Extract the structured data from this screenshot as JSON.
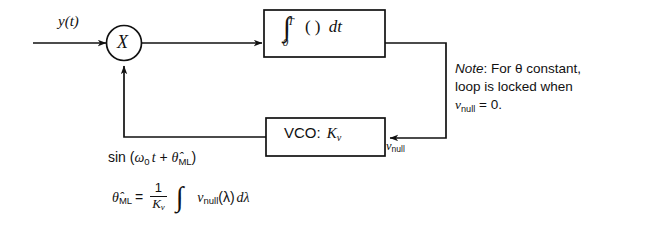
{
  "diagram": {
    "input_signal_label": "y(t)",
    "multiplier_symbol": "X",
    "integrator": {
      "name": "integrator-block",
      "expression": "∫₀ᵀ ( ) dt",
      "integral_symbol": "∫",
      "upper_limit": "T",
      "lower_limit": "0",
      "argument": "( )",
      "differential": "dt"
    },
    "vco": {
      "name": "vco-block",
      "label": "VCO:",
      "gain": "K",
      "gain_subscript": "v",
      "full_label": "VCO: Kᵥ"
    },
    "feedback_signal": {
      "prefix": "sin (",
      "omega": "ω",
      "omega_sub": "0",
      "time": "t",
      "plus": "+",
      "theta_hat": "θ̂",
      "theta_sub": "ML",
      "suffix": ")",
      "full": "sin (ω₀t + θ̂ML)"
    },
    "estimator_equation": {
      "lhs_symbol": "θ̂",
      "lhs_sub": "ML",
      "equals": "=",
      "fraction_numerator": "1",
      "fraction_denominator": "K",
      "fraction_denominator_sub": "v",
      "integral_symbol": "∫",
      "integrand_symbol": "ν",
      "integrand_sub": "null",
      "integrand_arg": "(λ)",
      "differential": "dλ",
      "full": "θ̂ML = (1/Kᵥ) ∫ νnull(λ) dλ"
    },
    "null_signal": {
      "symbol": "ν",
      "subscript": "null",
      "full": "νnull"
    },
    "note": {
      "keyword": "Note",
      "colon": ":",
      "line1_rest": " For θ constant,",
      "line2": "loop is locked when",
      "line3_symbol": "ν",
      "line3_sub": "null",
      "line3_rest": " = 0.",
      "full": "Note: For θ constant, loop is locked when νnull = 0."
    },
    "colors": {
      "line": "#111111",
      "background": "#ffffff",
      "text": "#111111"
    }
  }
}
